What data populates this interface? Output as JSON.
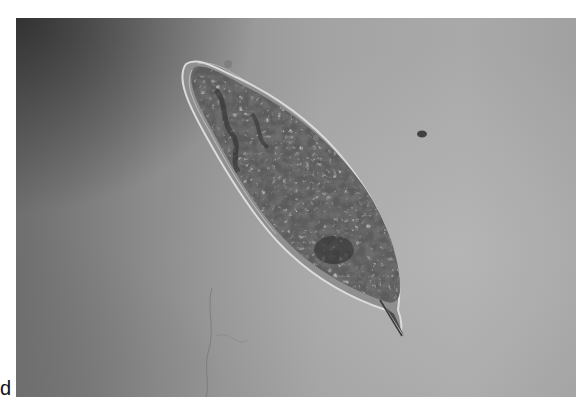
{
  "figure": {
    "panel_label": "d",
    "colors": {
      "background_dark": "#3c3c3c",
      "background_light": "#a9a9a9",
      "cell_body": "#5a5a5a",
      "cell_membrane": "#d8d8d8"
    }
  }
}
